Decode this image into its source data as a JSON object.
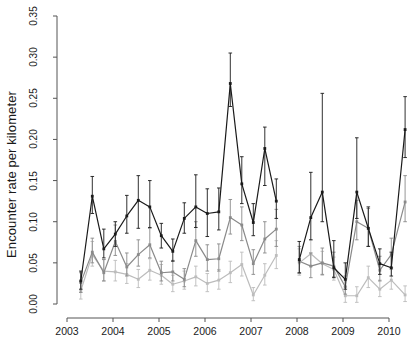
{
  "chart_data": {
    "type": "line",
    "title": "",
    "xlabel": "",
    "ylabel": "Encounter rate per kilometer",
    "xlim": [
      2003.0,
      2010.55
    ],
    "ylim": [
      0.0,
      0.35
    ],
    "grid": false,
    "legend": "none",
    "errorbars": true,
    "xtick_labels": [
      "2003",
      "2004",
      "2005",
      "2006",
      "2007",
      "2008",
      "2009",
      "2010"
    ],
    "xticks": [
      2003,
      2004,
      2005,
      2006,
      2007,
      2008,
      2009,
      2010
    ],
    "ytick_labels": [
      "0.00",
      "0.05",
      "0.10",
      "0.15",
      "0.20",
      "0.25",
      "0.30",
      "0.35"
    ],
    "yticks": [
      0.0,
      0.05,
      0.1,
      0.15,
      0.2,
      0.25,
      0.3,
      0.35
    ],
    "gap_note": "No data recorded between 2007.6 and 2008.05",
    "colors": {
      "series1": "#1a1a1a",
      "series2": "#8a8a8a",
      "series3": "#bcbcbc",
      "axis": "#555555"
    },
    "series": [
      {
        "name": "series-dark",
        "color": "#1a1a1a",
        "x": [
          2003.3,
          2003.55,
          2003.8,
          2004.05,
          2004.3,
          2004.55,
          2004.8,
          2005.05,
          2005.3,
          2005.55,
          2005.8,
          2006.05,
          2006.3,
          2006.55,
          2006.8,
          2007.05,
          2007.3,
          2007.55,
          2008.05,
          2008.3,
          2008.55,
          2008.8,
          2009.05,
          2009.3,
          2009.55,
          2009.8,
          2010.05,
          2010.35
        ],
        "values": [
          0.028,
          0.131,
          0.067,
          0.085,
          0.107,
          0.126,
          0.118,
          0.083,
          0.064,
          0.104,
          0.118,
          0.11,
          0.112,
          0.268,
          0.146,
          0.099,
          0.189,
          0.125,
          0.054,
          0.105,
          0.136,
          0.044,
          0.03,
          0.136,
          0.092,
          0.049,
          0.044,
          0.212
        ],
        "err_low": [
          0.018,
          0.11,
          0.056,
          0.07,
          0.086,
          0.092,
          0.093,
          0.068,
          0.052,
          0.086,
          0.093,
          0.082,
          0.09,
          0.24,
          0.122,
          0.083,
          0.144,
          0.104,
          0.038,
          0.078,
          0.1,
          0.032,
          0.018,
          0.104,
          0.07,
          0.036,
          0.034,
          0.178
        ],
        "err_high": [
          0.04,
          0.155,
          0.091,
          0.1,
          0.132,
          0.156,
          0.15,
          0.098,
          0.079,
          0.123,
          0.157,
          0.14,
          0.141,
          0.305,
          0.179,
          0.122,
          0.215,
          0.152,
          0.076,
          0.16,
          0.256,
          0.077,
          0.05,
          0.202,
          0.118,
          0.067,
          0.063,
          0.252
        ]
      },
      {
        "name": "series-mid",
        "color": "#8a8a8a",
        "x": [
          2003.3,
          2003.55,
          2003.8,
          2004.05,
          2004.3,
          2004.55,
          2004.8,
          2005.05,
          2005.3,
          2005.55,
          2005.8,
          2006.05,
          2006.3,
          2006.55,
          2006.8,
          2007.05,
          2007.3,
          2007.55,
          2008.05,
          2008.3,
          2008.55,
          2008.8,
          2009.05,
          2009.3,
          2009.55,
          2009.8,
          2010.05,
          2010.35
        ],
        "values": [
          0.026,
          0.063,
          0.038,
          0.076,
          0.045,
          0.06,
          0.072,
          0.038,
          0.039,
          0.03,
          0.077,
          0.054,
          0.055,
          0.105,
          0.096,
          0.049,
          0.079,
          0.091,
          0.052,
          0.046,
          0.05,
          0.046,
          0.021,
          0.1,
          0.092,
          0.041,
          0.06,
          0.124
        ],
        "err_low": [
          0.014,
          0.05,
          0.028,
          0.059,
          0.034,
          0.046,
          0.056,
          0.028,
          0.028,
          0.021,
          0.058,
          0.04,
          0.04,
          0.085,
          0.077,
          0.036,
          0.062,
          0.07,
          0.037,
          0.032,
          0.036,
          0.033,
          0.012,
          0.078,
          0.07,
          0.028,
          0.044,
          0.1
        ],
        "err_high": [
          0.038,
          0.08,
          0.054,
          0.096,
          0.062,
          0.078,
          0.092,
          0.052,
          0.053,
          0.043,
          0.1,
          0.072,
          0.073,
          0.127,
          0.118,
          0.066,
          0.1,
          0.115,
          0.07,
          0.062,
          0.068,
          0.063,
          0.034,
          0.126,
          0.116,
          0.058,
          0.08,
          0.156
        ]
      },
      {
        "name": "series-light",
        "color": "#bcbcbc",
        "x": [
          2003.3,
          2003.55,
          2003.8,
          2004.05,
          2004.3,
          2004.55,
          2004.8,
          2005.05,
          2005.3,
          2005.55,
          2005.8,
          2006.05,
          2006.3,
          2006.55,
          2006.8,
          2007.05,
          2007.3,
          2007.55,
          2008.05,
          2008.3,
          2008.55,
          2008.8,
          2009.05,
          2009.3,
          2009.55,
          2009.8,
          2010.05,
          2010.35
        ],
        "values": [
          0.016,
          0.06,
          0.04,
          0.039,
          0.036,
          0.03,
          0.041,
          0.035,
          0.024,
          0.028,
          0.033,
          0.025,
          0.029,
          0.038,
          0.048,
          0.011,
          0.035,
          0.059,
          0.05,
          0.061,
          0.049,
          0.042,
          0.01,
          0.01,
          0.032,
          0.018,
          0.029,
          0.011
        ],
        "err_low": [
          0.006,
          0.046,
          0.028,
          0.028,
          0.025,
          0.02,
          0.029,
          0.024,
          0.015,
          0.018,
          0.022,
          0.015,
          0.018,
          0.026,
          0.034,
          0.004,
          0.023,
          0.043,
          0.035,
          0.046,
          0.035,
          0.029,
          0.002,
          0.002,
          0.02,
          0.009,
          0.018,
          0.003
        ],
        "err_high": [
          0.028,
          0.076,
          0.054,
          0.053,
          0.049,
          0.042,
          0.055,
          0.048,
          0.035,
          0.04,
          0.046,
          0.037,
          0.042,
          0.052,
          0.063,
          0.02,
          0.049,
          0.077,
          0.067,
          0.078,
          0.064,
          0.057,
          0.021,
          0.021,
          0.046,
          0.029,
          0.042,
          0.022
        ]
      }
    ]
  }
}
